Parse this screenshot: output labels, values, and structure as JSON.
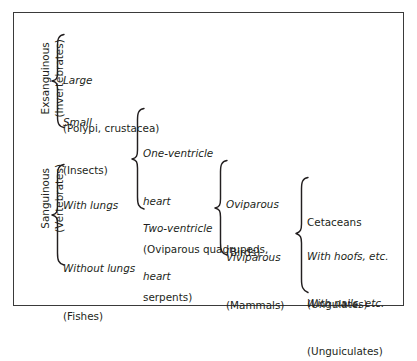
{
  "diagram": {
    "border_color": "#3a3a3a",
    "text_color": "#231f20",
    "background": "#ffffff",
    "root_groups": [
      {
        "id": "exsanguinous",
        "line1": "Exsanguinous",
        "line2": "(Invertebrates)"
      },
      {
        "id": "sanguinous",
        "line1": "Sanguinous",
        "line2": "(Vertebrates)"
      }
    ],
    "nodes": {
      "large": {
        "italic": "Large",
        "roman": "(Polypi, crustacea)"
      },
      "small": {
        "italic": "Small",
        "roman": "(Insects)"
      },
      "with_lungs": {
        "italic": "With lungs",
        "roman": ""
      },
      "without_lungs": {
        "italic": "Without lungs",
        "roman": "(Fishes)"
      },
      "one_ventricle": {
        "italic_line1": "One-ventricle",
        "italic_line2": "heart",
        "roman_line1": "(Oviparous quadrupeds,",
        "roman_line2": "serpents)"
      },
      "two_ventricle": {
        "italic_line1": "Two-ventricle",
        "italic_line2": "heart"
      },
      "oviparous": {
        "italic": "Oviparous",
        "roman": "(Birds)"
      },
      "viviparous": {
        "italic": "Viviparous",
        "roman": "(Mammals)"
      },
      "cetaceans": {
        "roman": "Cetaceans"
      },
      "ungulates": {
        "italic": "With hoofs, etc.",
        "roman": "(Ungulates)"
      },
      "unguiculates": {
        "italic": "With nails, etc.",
        "roman": "(Unguiculates)"
      }
    }
  }
}
